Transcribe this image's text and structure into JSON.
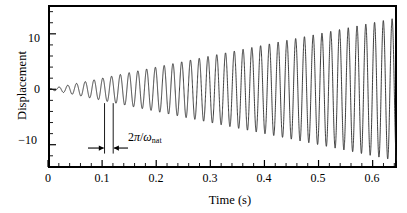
{
  "figure": {
    "background_color": "#ffffff",
    "line_color": "#1a1a1a",
    "axis_color": "#000000"
  },
  "axes": {
    "x_title": "Time (s)",
    "y_title": "Displacement",
    "x_ticks": [
      "0",
      "0.1",
      "0.2",
      "0.3",
      "0.4",
      "0.5",
      "0.6"
    ],
    "y_ticks": [
      "10",
      "0",
      "−10"
    ]
  },
  "annotation": {
    "label_prefix": "2",
    "label_pi": "π",
    "label_slash": "/",
    "label_omega": "ω",
    "label_sub": "nat",
    "full_text": "2π/ωnat"
  },
  "chart_data": {
    "type": "line",
    "title": "",
    "subtitle": "",
    "xlabel": "Time (s)",
    "ylabel": "Displacement",
    "xlim": [
      0,
      0.645
    ],
    "ylim": [
      -14.2,
      15.2
    ],
    "x_major_ticks": [
      0,
      0.1,
      0.2,
      0.3,
      0.4,
      0.5,
      0.6
    ],
    "x_minor_tick_step": 0.02,
    "y_major_ticks": [
      10,
      0,
      -10
    ],
    "y_minor_tick_step": 2,
    "grid": false,
    "legend": null,
    "model": {
      "form": "y(t) = A * t * sin(omega_nat * t)",
      "amplitude_growth_rate_per_s": 20.0,
      "natural_period_s": 0.0162,
      "natural_frequency_hz": 61.7,
      "omega_nat_rad_per_s": 387.8
    },
    "envelope": {
      "x": [
        0.0,
        0.05,
        0.1,
        0.15,
        0.2,
        0.25,
        0.3,
        0.35,
        0.4,
        0.45,
        0.5,
        0.55,
        0.6,
        0.645
      ],
      "upper": [
        0.0,
        1.0,
        2.0,
        3.0,
        4.0,
        5.0,
        6.0,
        7.0,
        8.0,
        9.0,
        10.0,
        11.0,
        12.0,
        12.9
      ],
      "lower": [
        0.0,
        -1.0,
        -2.0,
        -3.0,
        -4.0,
        -5.0,
        -6.0,
        -7.0,
        -8.0,
        -9.0,
        -10.0,
        -11.0,
        -12.0,
        -12.9
      ]
    },
    "peaks": [
      {
        "t": 0.012,
        "y": 0.24
      },
      {
        "t": 0.028,
        "y": 0.56
      },
      {
        "t": 0.044,
        "y": 0.88
      },
      {
        "t": 0.061,
        "y": 1.22
      },
      {
        "t": 0.077,
        "y": 1.54
      },
      {
        "t": 0.093,
        "y": 1.86
      },
      {
        "t": 0.109,
        "y": 2.18
      },
      {
        "t": 0.126,
        "y": 2.52
      },
      {
        "t": 0.142,
        "y": 2.84
      },
      {
        "t": 0.158,
        "y": 3.16
      },
      {
        "t": 0.174,
        "y": 3.48
      },
      {
        "t": 0.19,
        "y": 3.8
      },
      {
        "t": 0.207,
        "y": 4.14
      },
      {
        "t": 0.223,
        "y": 4.46
      },
      {
        "t": 0.239,
        "y": 4.78
      },
      {
        "t": 0.255,
        "y": 5.1
      },
      {
        "t": 0.271,
        "y": 5.42
      },
      {
        "t": 0.288,
        "y": 5.76
      },
      {
        "t": 0.304,
        "y": 6.08
      },
      {
        "t": 0.32,
        "y": 6.4
      },
      {
        "t": 0.336,
        "y": 6.72
      },
      {
        "t": 0.353,
        "y": 7.06
      },
      {
        "t": 0.369,
        "y": 7.38
      },
      {
        "t": 0.385,
        "y": 7.7
      },
      {
        "t": 0.401,
        "y": 8.02
      },
      {
        "t": 0.417,
        "y": 8.34
      },
      {
        "t": 0.434,
        "y": 8.68
      },
      {
        "t": 0.45,
        "y": 9.0
      },
      {
        "t": 0.466,
        "y": 9.32
      },
      {
        "t": 0.482,
        "y": 9.64
      },
      {
        "t": 0.498,
        "y": 9.96
      },
      {
        "t": 0.515,
        "y": 10.3
      },
      {
        "t": 0.531,
        "y": 10.62
      },
      {
        "t": 0.547,
        "y": 10.94
      },
      {
        "t": 0.563,
        "y": 11.26
      },
      {
        "t": 0.58,
        "y": 11.6
      },
      {
        "t": 0.596,
        "y": 11.92
      },
      {
        "t": 0.612,
        "y": 12.24
      },
      {
        "t": 0.628,
        "y": 12.56
      }
    ]
  }
}
